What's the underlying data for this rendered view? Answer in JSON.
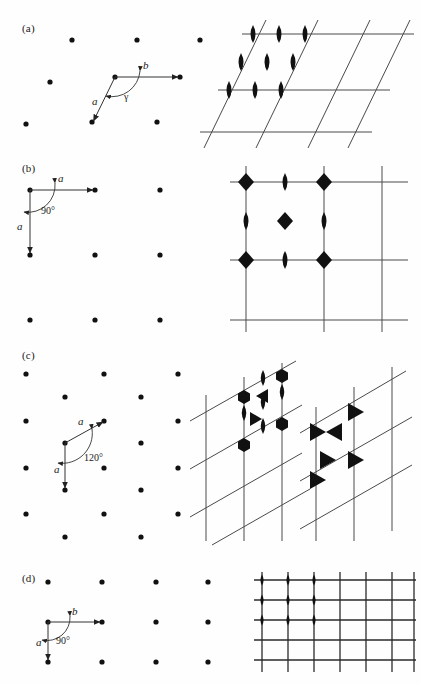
{
  "figure": {
    "panels": [
      {
        "id": "a",
        "label": "(a)",
        "lattice_type": "oblique",
        "cell": {
          "vectors": [
            {
              "name": "b",
              "label": "b",
              "direction": "right-horizontal"
            },
            {
              "name": "a",
              "label": "a",
              "direction": "down-left-oblique"
            }
          ],
          "angle_label": "γ",
          "angle_value": ""
        },
        "dot_lattice": {
          "rows": 4,
          "cols": 4,
          "row_shift": "oblique",
          "description": "oblique array of lattice points"
        },
        "symmetry_diagram": {
          "plane_group": "p2",
          "grid": {
            "horizontal_lines": 3,
            "oblique_lines": 3,
            "oblique": true
          },
          "markers": [
            {
              "type": "lens",
              "order": 2,
              "count": 9,
              "positions": "cell corners, edge midpoints and cell centre"
            }
          ]
        }
      },
      {
        "id": "b",
        "label": "(b)",
        "lattice_type": "square",
        "cell": {
          "vectors": [
            {
              "name": "a1",
              "label": "a",
              "direction": "right-horizontal"
            },
            {
              "name": "a2",
              "label": "a",
              "direction": "down-vertical"
            }
          ],
          "angle_label": "90°",
          "angle_value": "90"
        },
        "dot_lattice": {
          "rows": 3,
          "cols": 3,
          "row_shift": "none",
          "description": "square array of lattice points"
        },
        "symmetry_diagram": {
          "plane_group": "p4",
          "grid": {
            "horizontal_lines": 3,
            "vertical_lines": 3,
            "oblique": false
          },
          "markers": [
            {
              "type": "square",
              "order": 4,
              "count": 5,
              "positions": "cell corners and cell centre"
            },
            {
              "type": "lens",
              "order": 2,
              "count": 4,
              "positions": "edge midpoints"
            }
          ]
        }
      },
      {
        "id": "c",
        "label": "(c)",
        "lattice_type": "hexagonal",
        "cell": {
          "vectors": [
            {
              "name": "a1",
              "label": "a",
              "direction": "up-right-30deg"
            },
            {
              "name": "a2",
              "label": "a",
              "direction": "down-vertical"
            }
          ],
          "angle_label": "120°",
          "angle_value": "120"
        },
        "dot_lattice": {
          "rows": 6,
          "cols": 4,
          "row_shift": "alternating-half",
          "description": "hexagonal array of lattice points"
        },
        "symmetry_diagrams": [
          {
            "plane_group": "p6",
            "grid": {
              "vertical_lines": 3,
              "oblique_lines": 4,
              "oblique": true
            },
            "markers": [
              {
                "type": "hexagon",
                "order": 6,
                "count": 4,
                "positions": "cell corners"
              },
              {
                "type": "lens",
                "order": 2,
                "count": 5,
                "positions": "edge midpoints and cell centre"
              },
              {
                "type": "triangle",
                "order": 3,
                "count": 2,
                "positions": "1/3,2/3 and 2/3,1/3 of cell"
              }
            ]
          },
          {
            "plane_group": "p3",
            "grid": {
              "vertical_lines": 3,
              "oblique_lines": 3,
              "oblique": true
            },
            "markers": [
              {
                "type": "triangle",
                "order": 3,
                "count": 6,
                "positions": "cell corners and 1/3,2/3 and 2/3,1/3 of cell"
              }
            ]
          }
        ]
      },
      {
        "id": "d",
        "label": "(d)",
        "lattice_type": "rectangular",
        "cell": {
          "vectors": [
            {
              "name": "b",
              "label": "b",
              "direction": "right-horizontal"
            },
            {
              "name": "a",
              "label": "a",
              "direction": "down-vertical"
            }
          ],
          "angle_label": "90°",
          "angle_value": "90"
        },
        "dot_lattice": {
          "rows": 3,
          "cols": 4,
          "row_shift": "none",
          "description": "rectangular array of lattice points"
        },
        "symmetry_diagram": {
          "plane_group": "p2mm",
          "grid": {
            "vertical_lines": 7,
            "horizontal_lines": 6,
            "oblique": false
          },
          "markers": [
            {
              "type": "lens",
              "order": 2,
              "count": 9,
              "positions": "grid intersections of the upper-left cells"
            }
          ]
        }
      }
    ],
    "colors": {
      "ink": "#1a1a1a",
      "grid": "#4a4a4a",
      "grid_dark": "#2a2a2a",
      "marker": "#111111",
      "background": "#fefefe"
    }
  }
}
